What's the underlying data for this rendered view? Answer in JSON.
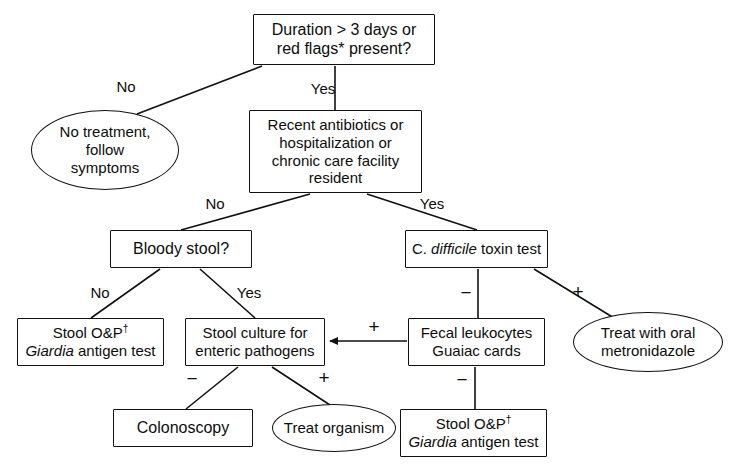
{
  "diagram": {
    "background_color": "#ffffff",
    "stroke_color": "#111111",
    "text_color": "#0d0d0d"
  },
  "nodes": [
    {
      "id": "duration-red-flags",
      "shape": "box",
      "lines": [
        "Duration > 3 days or",
        "red flags* present?"
      ],
      "x": 253,
      "y": 14,
      "w": 182,
      "h": 51,
      "font_size": 16
    },
    {
      "id": "no-treatment-follow-symptoms",
      "shape": "ellipse",
      "lines": [
        "No treatment,",
        "follow",
        "symptoms"
      ],
      "x": 31,
      "y": 110,
      "w": 148,
      "h": 80,
      "font_size": 15
    },
    {
      "id": "recent-antibiotics",
      "shape": "box",
      "lines": [
        "Recent antibiotics or",
        "hospitalization or",
        "chronic care facility",
        "resident"
      ],
      "x": 249,
      "y": 110,
      "w": 173,
      "h": 83,
      "font_size": 15
    },
    {
      "id": "bloody-stool",
      "shape": "box",
      "lines": [
        "Bloody stool?"
      ],
      "x": 110,
      "y": 230,
      "w": 142,
      "h": 38,
      "font_size": 16
    },
    {
      "id": "c-difficile-toxin-test",
      "shape": "box",
      "lines": [
        "C. difficile toxin test"
      ],
      "x": 405,
      "y": 230,
      "w": 143,
      "h": 38,
      "font_size": 15,
      "italic_words": [
        "difficile"
      ]
    },
    {
      "id": "stool-op-giardia-left",
      "shape": "box",
      "lines": [
        "Stool O&P†",
        "Giardia antigen test"
      ],
      "x": 17,
      "y": 318,
      "w": 147,
      "h": 48,
      "font_size": 15
    },
    {
      "id": "stool-culture-enteric",
      "shape": "box",
      "lines": [
        "Stool culture for",
        "enteric pathogens"
      ],
      "x": 185,
      "y": 318,
      "w": 140,
      "h": 48,
      "font_size": 15
    },
    {
      "id": "fecal-leukocytes-guaiac",
      "shape": "box",
      "lines": [
        "Fecal leukocytes",
        "Guaiac cards"
      ],
      "x": 408,
      "y": 318,
      "w": 137,
      "h": 48,
      "font_size": 15
    },
    {
      "id": "treat-with-oral-metronidazole",
      "shape": "ellipse",
      "lines": [
        "Treat with oral",
        "metronidazole"
      ],
      "x": 573,
      "y": 312,
      "w": 150,
      "h": 60,
      "font_size": 15
    },
    {
      "id": "colonoscopy",
      "shape": "box",
      "lines": [
        "Colonoscopy"
      ],
      "x": 113,
      "y": 409,
      "w": 140,
      "h": 38,
      "font_size": 16
    },
    {
      "id": "treat-organism",
      "shape": "ellipse",
      "lines": [
        "Treat organism"
      ],
      "x": 272,
      "y": 404,
      "w": 124,
      "h": 48,
      "font_size": 15
    },
    {
      "id": "stool-op-giardia-right",
      "shape": "box",
      "lines": [
        "Stool O&P†",
        "Giardia antigen test"
      ],
      "x": 400,
      "y": 409,
      "w": 147,
      "h": 48,
      "font_size": 15
    }
  ],
  "edges": [
    {
      "id": "duration-to-no-treatment",
      "label": "No",
      "label_x": 126,
      "label_y": 86,
      "path": "M 262,66 L 137,114",
      "arrow": false
    },
    {
      "id": "duration-to-recent-antibiotics",
      "label": "Yes",
      "label_x": 323,
      "label_y": 88,
      "path": "M 335,66 L 335,110",
      "arrow": false
    },
    {
      "id": "recent-antibiotics-to-bloody-stool",
      "label": "No",
      "label_x": 215,
      "label_y": 203,
      "path": "M 310,194 L 181,230",
      "arrow": false
    },
    {
      "id": "recent-antibiotics-to-cdiff",
      "label": "Yes",
      "label_x": 432,
      "label_y": 203,
      "path": "M 367,194 L 477,230",
      "arrow": false
    },
    {
      "id": "bloody-stool-no-to-stool-op",
      "label": "No",
      "label_x": 100,
      "label_y": 292,
      "path": "M 160,269 L 91,318",
      "arrow": false
    },
    {
      "id": "bloody-stool-yes-to-stool-culture",
      "label": "Yes",
      "label_x": 249,
      "label_y": 292,
      "path": "M 200,269 L 255,318",
      "arrow": false
    },
    {
      "id": "cdiff-negative-to-fecal-leukocytes",
      "label": "−",
      "label_x": 466,
      "label_y": 293,
      "path": "M 478,269 L 478,318",
      "arrow": false
    },
    {
      "id": "cdiff-positive-to-metronidazole",
      "label": "+",
      "label_x": 578,
      "label_y": 292,
      "path": "M 534,269 L 614,318",
      "arrow": false
    },
    {
      "id": "fecal-leukocytes-positive-to-stool-culture",
      "label": "+",
      "label_x": 374,
      "label_y": 327,
      "path": "M 407,341 L 330,341",
      "arrow": true
    },
    {
      "id": "fecal-leukocytes-negative-to-stool-op",
      "label": "−",
      "label_x": 462,
      "label_y": 380,
      "path": "M 475,367 L 475,409",
      "arrow": false
    },
    {
      "id": "stool-culture-negative-to-colonoscopy",
      "label": "−",
      "label_x": 192,
      "label_y": 379,
      "path": "M 238,367 L 186,409",
      "arrow": false
    },
    {
      "id": "stool-culture-positive-to-treat-organism",
      "label": "+",
      "label_x": 324,
      "label_y": 378,
      "path": "M 272,367 L 330,405",
      "arrow": false
    }
  ]
}
